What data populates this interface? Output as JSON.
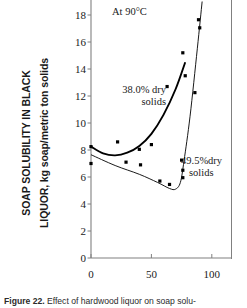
{
  "figure": {
    "caption_label": "Figure 22.",
    "caption_text": " Effect of hardwood liquor on soap solu-"
  },
  "axes": {
    "ylabel_line1": "SOAP SOLUBILITY IN BLACK",
    "ylabel_line2": "LIQUOR, kg soap/metric ton solids",
    "yticks": [
      "0",
      "2",
      "4",
      "6",
      "8",
      "10",
      "12",
      "14",
      "16",
      "18"
    ],
    "xticks": [
      "0",
      "50",
      "100"
    ],
    "xlabel": ""
  },
  "annotations": {
    "condition": "At 90°C",
    "series1_line1": "38.0% dry",
    "series1_line2": "solids",
    "series2_line1": "49.5%dry",
    "series2_line2": "solids"
  },
  "colors": {
    "ink": "#1a1a1a",
    "axis": "#808080",
    "curve": "#000000",
    "marker": "#000000"
  },
  "chart_data": {
    "type": "scatter",
    "title": "At 90°C",
    "xlabel": "",
    "ylabel": "SOAP SOLUBILITY IN BLACK LIQUOR, kg soap/metric ton solids",
    "xlim": [
      -5,
      115
    ],
    "ylim": [
      0,
      19
    ],
    "xticks": [
      0,
      50,
      100
    ],
    "yticks": [
      0,
      2,
      4,
      6,
      8,
      10,
      12,
      14,
      16,
      18
    ],
    "grid": false,
    "legend": "annotation",
    "series": [
      {
        "name": "38.0% dry solids",
        "marker": "square",
        "points": [
          {
            "x": 0,
            "y": 8.25
          },
          {
            "x": 22,
            "y": 8.6
          },
          {
            "x": 40,
            "y": 8.05
          },
          {
            "x": 50,
            "y": 8.4
          },
          {
            "x": 63,
            "y": 12.7
          },
          {
            "x": 76,
            "y": 15.2
          },
          {
            "x": 78,
            "y": 13.5
          }
        ],
        "fit_curve": [
          {
            "x": 0,
            "y": 8.25
          },
          {
            "x": 10,
            "y": 7.75
          },
          {
            "x": 20,
            "y": 7.6
          },
          {
            "x": 30,
            "y": 7.8
          },
          {
            "x": 40,
            "y": 8.3
          },
          {
            "x": 50,
            "y": 9.2
          },
          {
            "x": 60,
            "y": 10.6
          },
          {
            "x": 70,
            "y": 12.5
          },
          {
            "x": 78,
            "y": 14.5
          }
        ]
      },
      {
        "name": "49.5% dry solids",
        "marker": "square",
        "points": [
          {
            "x": 0,
            "y": 7.0
          },
          {
            "x": 29,
            "y": 7.1
          },
          {
            "x": 41,
            "y": 6.9
          },
          {
            "x": 57,
            "y": 5.7
          },
          {
            "x": 65,
            "y": 5.45
          },
          {
            "x": 75,
            "y": 7.25
          },
          {
            "x": 76,
            "y": 6.5
          },
          {
            "x": 76,
            "y": 5.95
          },
          {
            "x": 86,
            "y": 12.25
          },
          {
            "x": 90,
            "y": 17.05
          },
          {
            "x": 89,
            "y": 17.65
          }
        ],
        "fit_curve": [
          {
            "x": 0,
            "y": 7.65
          },
          {
            "x": 20,
            "y": 6.85
          },
          {
            "x": 40,
            "y": 6.2
          },
          {
            "x": 55,
            "y": 5.6
          },
          {
            "x": 65,
            "y": 5.15
          },
          {
            "x": 70,
            "y": 5.1
          },
          {
            "x": 74,
            "y": 5.6
          },
          {
            "x": 77,
            "y": 7.2
          },
          {
            "x": 82,
            "y": 10.5
          },
          {
            "x": 88,
            "y": 15.5
          },
          {
            "x": 92,
            "y": 19.0
          }
        ]
      }
    ]
  }
}
